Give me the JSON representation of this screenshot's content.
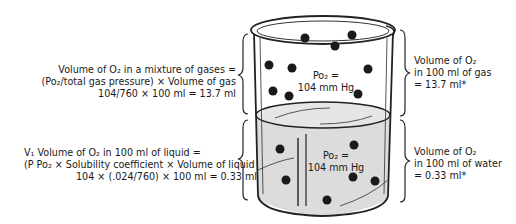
{
  "left_gas": {
    "line1": "Volume of O₂ in a mixture of gases =",
    "line2": "(Po₂/total gas pressure) × Volume of gas",
    "line3": "104/760 × 100 ml = 13.7 ml"
  },
  "left_liquid": {
    "line1": "V₁ Volume of O₂ in 100 ml of liquid =",
    "line2": "(P Po₂ × Solubility coefficient × Volume of liquid",
    "line3": "104 × (.024/760) × 100 ml = 0.33 ml"
  },
  "beaker": {
    "gas_label_1": "Po₂ =",
    "gas_label_2": "104 mm Hg",
    "liquid_label_1": "Po₂ =",
    "liquid_label_2": "104 mm Hg"
  },
  "right_gas": {
    "line1": "Volume of O₂",
    "line2": "in 100 ml of gas",
    "line3": "= 13.7 ml*"
  },
  "right_liquid": {
    "line1": "Volume of O₂",
    "line2": "in 100 ml of water",
    "line3": "= 0.33 ml*"
  },
  "colors": {
    "liquid": "#dcdcdc",
    "outline": "#222222",
    "molecule": "#1a1a1a"
  }
}
